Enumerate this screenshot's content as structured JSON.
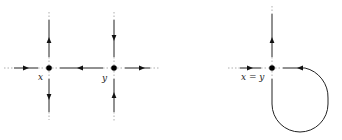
{
  "diagram": {
    "left_panel": {
      "nodes": [
        {
          "id": "x",
          "label": "x",
          "cx": 49,
          "cy": 68
        },
        {
          "id": "y",
          "label": "y",
          "cx": 114,
          "cy": 68
        }
      ]
    },
    "right_panel": {
      "nodes": [
        {
          "id": "xy",
          "label": "x = y",
          "cx": 272,
          "cy": 68
        }
      ]
    },
    "colors": {
      "line": "#222222",
      "dotted": "#999999",
      "node": "#000000"
    }
  }
}
